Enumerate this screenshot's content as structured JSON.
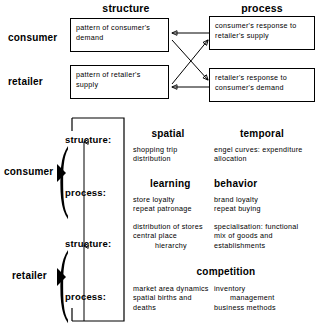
{
  "diagram": {
    "title_row": {
      "structure": "structure",
      "process": "process"
    },
    "row_labels": {
      "consumer": "consumer",
      "retailer": "retailer"
    },
    "boxes": {
      "consumer_structure": [
        "pattern of consumer's",
        "demand"
      ],
      "consumer_process": [
        "consumer's response to",
        "retailer's supply"
      ],
      "retailer_structure": [
        "pattern of retailer's",
        "supply"
      ],
      "retailer_process": [
        "retailer's response to",
        "consumer's demand"
      ]
    },
    "lower": {
      "consumer_label": "consumer",
      "retailer_label": "retailer",
      "sub_labels": {
        "structure": "structure:",
        "process": "process:"
      },
      "consumer_structure": {
        "heading_left": "spatial",
        "heading_right": "temporal",
        "left_lines": [
          "shopping  trip",
          "distribution"
        ],
        "right_lines": [
          "engel curves: expenditure",
          "allocation"
        ]
      },
      "consumer_process": {
        "heading_left": "learning",
        "heading_right": "behavior",
        "left_lines": [
          "store  loyalty",
          "repeat patronage"
        ],
        "right_lines": [
          "brand  loyalty",
          "repeat  buying"
        ]
      },
      "retailer_structure": {
        "left_lines": [
          "distribution of stores",
          "central place",
          "hierarchy"
        ],
        "right_lines": [
          "specialisation: functional",
          "mix of  goods  and",
          "establishments"
        ]
      },
      "retailer_process": {
        "heading": "competition",
        "left_lines": [
          "market  area dynamics",
          "spatial births and",
          "deaths"
        ],
        "right_lines": [
          "inventory",
          "management",
          "business methods"
        ]
      }
    }
  }
}
